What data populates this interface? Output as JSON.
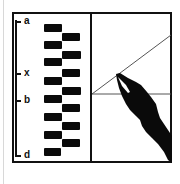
{
  "figure": {
    "type": "diagram",
    "colors": {
      "ink": "#111111",
      "background": "#ffffff",
      "line": "#555555"
    }
  },
  "left_panel": {
    "scale_labels": [
      {
        "label": "a",
        "y": 22
      },
      {
        "label": "x",
        "y": 73
      },
      {
        "label": "b",
        "y": 100
      },
      {
        "label": "d",
        "y": 155
      }
    ],
    "bars_left_column": [
      24,
      41,
      58,
      77,
      95,
      113,
      131,
      148
    ],
    "bars_right_column": [
      33,
      51,
      69,
      87,
      104,
      122,
      139
    ]
  },
  "right_panel": {
    "vertex": [
      92,
      94
    ],
    "horizontal_line_end": [
      171,
      94
    ],
    "diagonal_line_end": [
      171,
      35
    ],
    "pen_icon": "pen-nib-icon"
  }
}
